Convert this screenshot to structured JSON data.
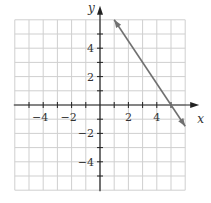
{
  "chart_data": {
    "type": "line",
    "title": "",
    "xlabel": "x",
    "ylabel": "y",
    "xlim": [
      -6,
      6
    ],
    "ylim": [
      -6,
      6
    ],
    "grid": true,
    "x_tick_labels": [
      "-4",
      "-2",
      "2",
      "4"
    ],
    "y_tick_labels": [
      "4",
      "2",
      "-2",
      "-4"
    ],
    "series": [
      {
        "name": "line",
        "equation": "y = -1.5x + 7.5",
        "points": [
          [
            1,
            6
          ],
          [
            5,
            0
          ],
          [
            6,
            -1.5
          ]
        ],
        "arrows": "both",
        "color": "#707070"
      }
    ]
  },
  "colors": {
    "grid": "#cfcfcf",
    "axis": "#222222",
    "line": "#707070"
  }
}
